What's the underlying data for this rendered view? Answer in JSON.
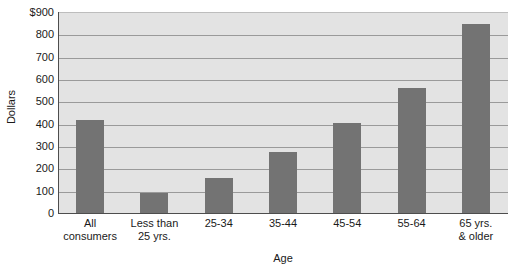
{
  "chart_data": {
    "type": "bar",
    "title": "",
    "xlabel": "Age",
    "ylabel": "Dollars",
    "categories": [
      "All consumers",
      "Less than 25 yrs.",
      "25-34",
      "35-44",
      "45-54",
      "55-64",
      "65 yrs. & older"
    ],
    "category_lines": [
      [
        "All",
        "consumers"
      ],
      [
        "Less than",
        "25 yrs."
      ],
      [
        "25-34",
        ""
      ],
      [
        "35-44",
        ""
      ],
      [
        "45-54",
        ""
      ],
      [
        "55-64",
        ""
      ],
      [
        "65 yrs.",
        "& older"
      ]
    ],
    "values": [
      415,
      90,
      157,
      273,
      402,
      562,
      845
    ],
    "ylim": [
      0,
      900
    ],
    "ytick_values": [
      0,
      100,
      200,
      300,
      400,
      500,
      600,
      700,
      800,
      900
    ],
    "ytick_labels": [
      "0",
      "100",
      "200",
      "300",
      "400",
      "500",
      "600",
      "700",
      "800",
      "$900"
    ],
    "grid": true,
    "grid_axis": "y",
    "legend": "none",
    "bar_color": "#737373",
    "plot_background": "#e3e3e3",
    "gridline_color": "#9a9a9a",
    "axis_color": "#4d4d4d",
    "text_color": "#1a1a1a"
  }
}
